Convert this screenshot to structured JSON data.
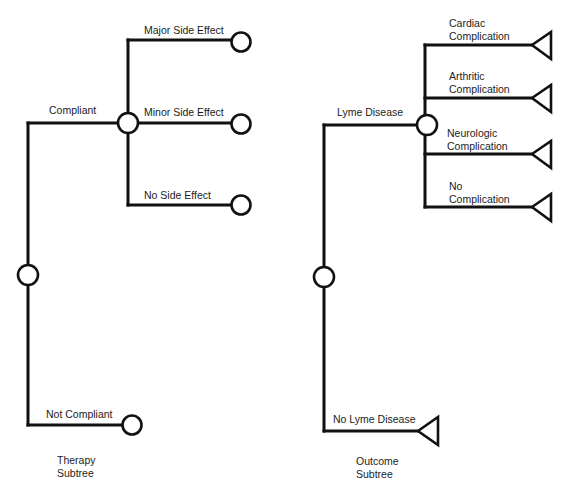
{
  "diagram": {
    "type": "decision-tree",
    "colors": {
      "line": "#111111",
      "node_fill": "#ffffff",
      "text": "#1c1c1c",
      "background": "#ffffff"
    },
    "therapy_subtree": {
      "caption_line1": "Therapy",
      "caption_line2": "Subtree",
      "root_node": "chance",
      "branches": [
        {
          "label": "Compliant",
          "node": "chance",
          "branches": [
            {
              "label": "Major Side Effect",
              "node": "terminal-circle"
            },
            {
              "label": "Minor Side Effect",
              "node": "terminal-circle"
            },
            {
              "label": "No Side Effect",
              "node": "terminal-circle"
            }
          ]
        },
        {
          "label": "Not Compliant",
          "node": "terminal-circle"
        }
      ]
    },
    "outcome_subtree": {
      "caption_line1": "Outcome",
      "caption_line2": "Subtree",
      "root_node": "chance",
      "branches": [
        {
          "label": "Lyme Disease",
          "node": "chance",
          "branches": [
            {
              "label_line1": "Cardiac",
              "label_line2": "Complication",
              "node": "triangle"
            },
            {
              "label_line1": "Arthritic",
              "label_line2": "Complication",
              "node": "triangle"
            },
            {
              "label_line1": "Neurologic",
              "label_line2": "Complication",
              "node": "triangle"
            },
            {
              "label_line1": "No",
              "label_line2": "Complication",
              "node": "triangle"
            }
          ]
        },
        {
          "label": "No Lyme Disease",
          "node": "triangle"
        }
      ]
    }
  }
}
